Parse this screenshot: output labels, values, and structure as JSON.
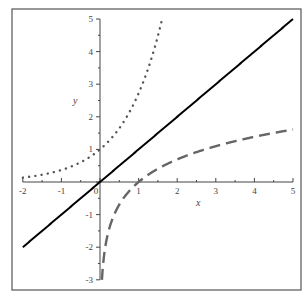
{
  "chart_data": {
    "type": "line",
    "title": "",
    "xlabel": "x",
    "ylabel": "y",
    "xlim": [
      -2,
      5
    ],
    "ylim": [
      -3,
      5
    ],
    "grid": false,
    "legend": null,
    "xticks": [
      "-2",
      "-1",
      "0",
      "1",
      "2",
      "3",
      "4",
      "5"
    ],
    "yticks": [
      "-3",
      "-2",
      "-1",
      "1",
      "2",
      "3",
      "4",
      "5"
    ],
    "series": [
      {
        "name": "y = e^x",
        "style": "dotted",
        "color": "#555555",
        "x": [
          -2,
          -1.5,
          -1,
          -0.5,
          0,
          0.5,
          1,
          1.25,
          1.5,
          1.609
        ],
        "y": [
          0.135,
          0.223,
          0.368,
          0.607,
          1,
          1.649,
          2.718,
          3.49,
          4.482,
          5
        ]
      },
      {
        "name": "y = x",
        "style": "solid",
        "color": "#000000",
        "x": [
          -2,
          5
        ],
        "y": [
          -2,
          5
        ]
      },
      {
        "name": "y = ln(x)",
        "style": "dashed",
        "color": "#666666",
        "x": [
          0.05,
          0.1,
          0.2,
          0.5,
          1,
          2,
          3,
          4,
          5
        ],
        "y": [
          -3,
          -2.303,
          -1.609,
          -0.693,
          0,
          0.693,
          1.099,
          1.386,
          1.609
        ]
      }
    ]
  },
  "colors": {
    "frame": "#555555",
    "axis": "#444444"
  }
}
